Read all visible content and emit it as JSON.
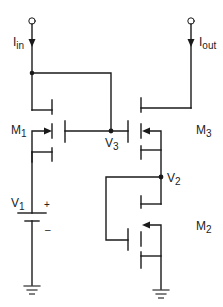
{
  "diagram": {
    "type": "circuit-schematic",
    "title": "",
    "colors": {
      "wire": "#1a1a1a",
      "background": "#ffffff"
    },
    "terminals": {
      "input": {
        "label_main": "I",
        "label_sub": "in"
      },
      "output": {
        "label_main": "I",
        "label_sub": "out"
      }
    },
    "transistors": [
      {
        "id": "M1",
        "label_main": "M",
        "label_sub": "1"
      },
      {
        "id": "M3",
        "label_main": "M",
        "label_sub": "3"
      },
      {
        "id": "M2",
        "label_main": "M",
        "label_sub": "2"
      }
    ],
    "nodes": {
      "v3": {
        "label_main": "V",
        "label_sub": "3"
      },
      "v2": {
        "label_main": "V",
        "label_sub": "2"
      }
    },
    "source": {
      "label_main": "V",
      "label_sub": "1",
      "plus": "+",
      "minus": "–"
    }
  }
}
